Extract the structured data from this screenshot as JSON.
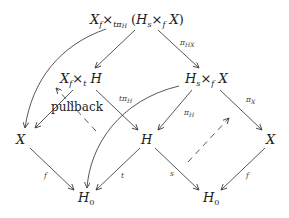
{
  "diagram": {
    "type": "commutative-diagram",
    "nodes": {
      "top": {
        "base": "X",
        "sub1": "f",
        "times": "×",
        "sub2": "tπ",
        "sub2b": "H",
        "rest": " (H",
        "s": "s",
        "times2": "×",
        "f": "f",
        "end": " X)"
      },
      "left_mid": {
        "base": "X",
        "sub1": "f",
        "times": "×",
        "sub2": "t",
        "end": " H"
      },
      "right_mid": {
        "base": "H",
        "sub1": "s",
        "times": "×",
        "sub2": "f",
        "end": " X"
      },
      "x_left": "X",
      "h_center": "H",
      "x_right": "X",
      "h0_left": "H",
      "h0_left_sub": "0",
      "h0_right": "H",
      "h0_right_sub": "0"
    },
    "edge_labels": {
      "pi_hx": "π",
      "pi_hx_sub": "HX",
      "t_pi_h": "tπ",
      "t_pi_h_sub": "H",
      "pi_x": "π",
      "pi_x_sub": "X",
      "pi_h": "π",
      "pi_h_sub": "H",
      "f_left": "f",
      "t": "t",
      "s": "s",
      "f_right": "f"
    },
    "annotation": "pullback"
  }
}
